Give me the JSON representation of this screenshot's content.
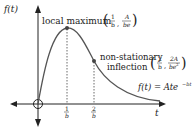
{
  "diagram": {
    "y_axis_label": "f(t)",
    "x_axis_label": "t",
    "function_label": "f(t) = Ate",
    "function_exponent": "−bt",
    "max_label": "local maximum",
    "max_coord": {
      "x_num": "1",
      "x_den": "b",
      "y_num": "A",
      "y_den": "be"
    },
    "inflection_label_line1": "non-stationary",
    "inflection_label_line2": "inflection",
    "inflection_coord": {
      "x_num": "2",
      "x_den": "b",
      "y_num": "2A",
      "y_den": "be",
      "y_den_sup": "2"
    },
    "tick_1": {
      "num": "1",
      "den": "b"
    },
    "tick_2": {
      "num": "2",
      "den": "b"
    },
    "colors": {
      "axis": "#222222",
      "curve": "#555555",
      "point": "#444444"
    }
  }
}
